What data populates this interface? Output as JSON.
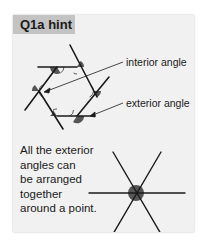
{
  "card": {
    "title": "Q1a hint",
    "labels": {
      "interior": "interior angle",
      "exterior": "exterior angle"
    },
    "body_lines": [
      "All the exterior",
      "angles can",
      "be arranged",
      "together",
      "around a point."
    ]
  },
  "diagram": {
    "hexagon_description": "Hexagon with extended sides; interior angles marked with open arcs, exterior angles shaded",
    "point_description": "Six lines through a single point; exterior angles shaded around the point"
  },
  "colors": {
    "card_background": "#f1f1f1",
    "tab_background": "#c3c3c3",
    "line": "#1a1a1a",
    "shaded_angle": "#5a5a5a"
  }
}
